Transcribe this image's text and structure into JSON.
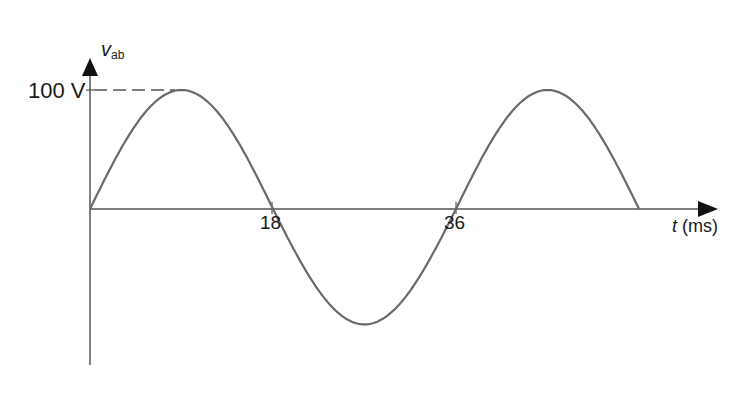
{
  "chart_data": {
    "type": "line",
    "title": "",
    "xlabel": "t (ms)",
    "ylabel": "v_ab",
    "ylabel_main": "v",
    "ylabel_sub": "ab",
    "xlabel_var": "t",
    "xlabel_unit": "(ms)",
    "x_ticks": [
      "18",
      "36"
    ],
    "y_ticks": [
      "100 V"
    ],
    "xlim": [
      0,
      54
    ],
    "ylim": [
      -100,
      100
    ],
    "grid": false,
    "legend": null,
    "series": [
      {
        "name": "v_ab",
        "function": "100*sin(2*pi*t/36)",
        "x": [
          0,
          4.5,
          9,
          13.5,
          18,
          22.5,
          27,
          31.5,
          36,
          40.5,
          45,
          49.5,
          54
        ],
        "values": [
          0,
          70.7,
          100,
          70.7,
          0,
          -70.7,
          -100,
          -70.7,
          0,
          70.7,
          100,
          70.7,
          0
        ]
      }
    ],
    "annotations": [
      "dashed line from 100 V tick to first peak"
    ],
    "amplitude": 100,
    "period_ms": 36
  }
}
